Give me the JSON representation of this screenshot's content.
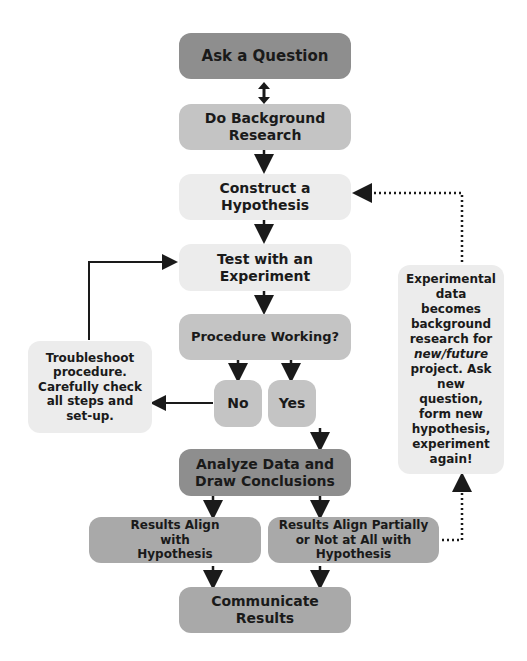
{
  "diagram": {
    "nodes": {
      "ask_question": "Ask a Question",
      "background_research": "Do Background Research",
      "hypothesis": "Construct a Hypothesis",
      "experiment": "Test with an Experiment",
      "procedure_working": "Procedure Working?",
      "no": "No",
      "yes": "Yes",
      "troubleshoot": "Troubleshoot procedure. Carefully check all steps and set-up.",
      "analyze": "Analyze Data and Draw Conclusions",
      "results_align": "Results Align with Hypothesis",
      "results_partial": "Results Align Partially or Not at All with Hypothesis",
      "communicate": "Communicate Results",
      "feedback_pre": "Experimental data becomes background research for",
      "feedback_em": "new/future",
      "feedback_post": "project. Ask new question, form new hypothesis, experiment again!"
    },
    "colors": {
      "dark": "#8e8e8e",
      "mid": "#a9a9a9",
      "light": "#c4c4c4",
      "pale": "#ececec",
      "arrow": "#1a1a1a"
    }
  }
}
